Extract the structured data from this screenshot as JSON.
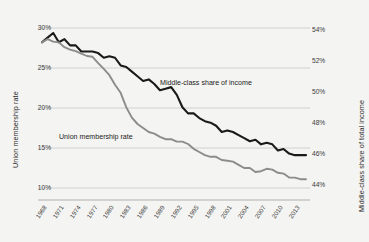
{
  "chart_data": {
    "type": "line",
    "title": "",
    "subtitle": "",
    "xlabel": "",
    "grid": true,
    "legend_position": "inline-annotations",
    "x": [
      1968,
      1969,
      1970,
      1971,
      1972,
      1973,
      1974,
      1975,
      1976,
      1977,
      1978,
      1979,
      1980,
      1981,
      1982,
      1983,
      1984,
      1985,
      1986,
      1987,
      1988,
      1989,
      1990,
      1991,
      1992,
      1993,
      1994,
      1995,
      1996,
      1997,
      1998,
      1999,
      2000,
      2001,
      2002,
      2003,
      2004,
      2005,
      2006,
      2007,
      2008,
      2009,
      2010,
      2011,
      2012,
      2013,
      2014,
      2015
    ],
    "xtick_labels": [
      "1968",
      "1971",
      "1974",
      "1977",
      "1980",
      "1983",
      "1986",
      "1989",
      "1992",
      "1995",
      "1998",
      "2001",
      "2004",
      "2007",
      "2010",
      "2013"
    ],
    "axes": [
      {
        "id": "left",
        "label": "Union membership rate",
        "ticks": [
          "30%",
          "25%",
          "20%",
          "15%",
          "10%"
        ],
        "tick_values": [
          30,
          25,
          20,
          15,
          10
        ],
        "ylim": [
          8.5,
          31.5
        ]
      },
      {
        "id": "right",
        "label": "Middle-class share of total income",
        "ticks": [
          "54%",
          "52%",
          "50%",
          "48%",
          "46%",
          "44%"
        ],
        "tick_values": [
          54,
          52,
          50,
          48,
          46,
          44
        ],
        "ylim": [
          43.0,
          54.9
        ]
      }
    ],
    "series": [
      {
        "name": "Middle-class share of income",
        "axis": "right",
        "color": "#1a1a1a",
        "annotation": "Middle-class share of income",
        "values": [
          53.2,
          53.5,
          53.8,
          53.2,
          53.4,
          53.0,
          53.0,
          52.6,
          52.6,
          52.6,
          52.5,
          52.2,
          52.3,
          52.2,
          51.7,
          51.6,
          51.3,
          51.0,
          50.7,
          50.8,
          50.5,
          50.1,
          50.2,
          50.3,
          49.8,
          49.0,
          48.6,
          48.6,
          48.3,
          48.1,
          48.0,
          47.8,
          47.4,
          47.5,
          47.4,
          47.2,
          47.0,
          46.8,
          46.9,
          46.6,
          46.7,
          46.6,
          46.2,
          46.3,
          46.0,
          45.9,
          45.9,
          45.9
        ]
      },
      {
        "name": "Union membership rate",
        "axis": "left",
        "color": "#8c8c8c",
        "annotation": "Union membership rate",
        "values": [
          28.2,
          28.6,
          28.3,
          28.2,
          27.6,
          27.3,
          27.1,
          26.8,
          26.5,
          26.4,
          25.6,
          24.9,
          24.1,
          22.9,
          21.9,
          20.1,
          18.8,
          18.0,
          17.5,
          17.0,
          16.8,
          16.4,
          16.1,
          16.1,
          15.8,
          15.8,
          15.5,
          14.9,
          14.5,
          14.1,
          13.9,
          13.9,
          13.5,
          13.4,
          13.3,
          12.9,
          12.5,
          12.5,
          12.0,
          12.1,
          12.4,
          12.3,
          11.9,
          11.8,
          11.3,
          11.3,
          11.1,
          11.1
        ]
      }
    ]
  }
}
